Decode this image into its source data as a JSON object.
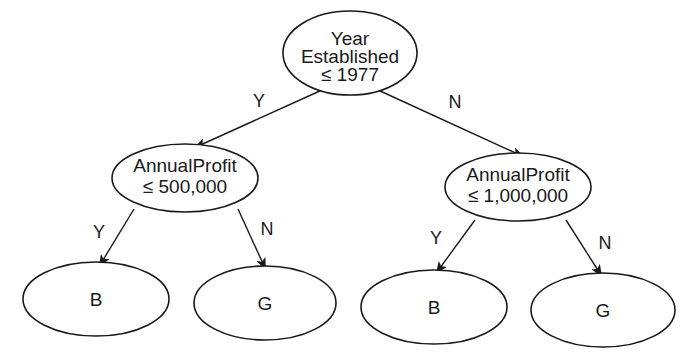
{
  "diagram": {
    "type": "decision-tree",
    "root": {
      "line1": "Year",
      "line2": "Established",
      "line3": "≤  1977"
    },
    "left_branch": {
      "edge_label": "Y",
      "node": {
        "line1": "AnnualProfit",
        "line2": "≤  500,000"
      },
      "children": [
        {
          "edge_label": "Y",
          "leaf": "B"
        },
        {
          "edge_label": "N",
          "leaf": "G"
        }
      ]
    },
    "right_branch": {
      "edge_label": "N",
      "node": {
        "line1": "AnnualProfit",
        "line2": "≤ 1,000,000"
      },
      "children": [
        {
          "edge_label": "Y",
          "leaf": "B"
        },
        {
          "edge_label": "N",
          "leaf": "G"
        }
      ]
    }
  }
}
